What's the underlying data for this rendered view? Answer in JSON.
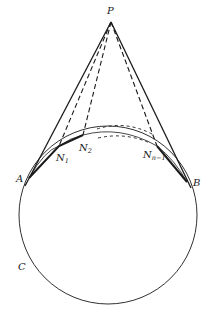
{
  "diagram": {
    "labels": {
      "P": "P",
      "A": "A",
      "B": "B",
      "C": "C",
      "N1": "N",
      "N1_sub": "1",
      "N2": "N",
      "N2_sub": "2",
      "Nn1": "N",
      "Nn1_sub": "n−1"
    },
    "points": {
      "P": [
        111,
        22
      ],
      "A": [
        29,
        178
      ],
      "B": [
        187,
        182
      ],
      "N1": [
        59,
        146
      ],
      "N2": [
        83,
        135
      ],
      "Nn1": [
        157,
        146
      ]
    },
    "circle": {
      "cx": 108,
      "cy": 215,
      "r": 89
    },
    "colors": {
      "stroke": "#1a1a1a",
      "background": "#ffffff"
    }
  }
}
